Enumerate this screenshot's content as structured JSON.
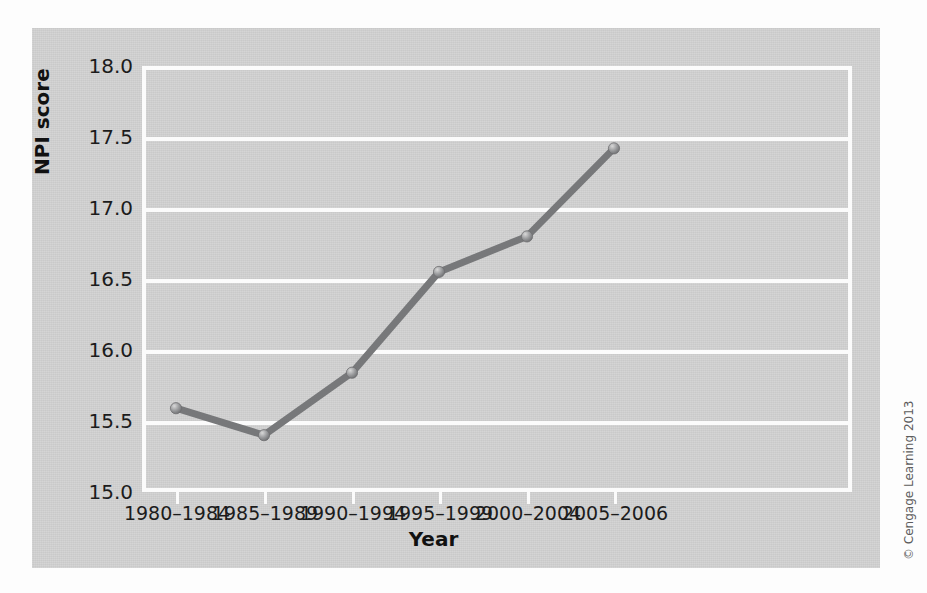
{
  "chart_data": {
    "type": "line",
    "title": "",
    "xlabel": "Year",
    "ylabel": "NPI score",
    "categories": [
      "1980–1984",
      "1985–1989",
      "1990–1994",
      "1995–1999",
      "2000–2004",
      "2005–2006"
    ],
    "values": [
      15.59,
      15.4,
      15.84,
      16.55,
      16.8,
      17.42
    ],
    "series": [
      {
        "name": "NPI score",
        "values": [
          15.59,
          15.4,
          15.84,
          16.55,
          16.8,
          17.42
        ]
      }
    ],
    "ylim": [
      15.0,
      18.0
    ],
    "yticks": [
      15.0,
      15.5,
      16.0,
      16.5,
      17.0,
      17.5,
      18.0
    ],
    "ytick_labels": [
      "15.0",
      "15.5",
      "16.0",
      "16.5",
      "17.0",
      "17.5",
      "18.0"
    ],
    "grid": "horizontal",
    "legend": "none",
    "line_color": "#77787a",
    "marker_color": "#8d8e90",
    "grid_color": "#fbfbfb",
    "plot_background": "#d2d2d2"
  },
  "axes": {
    "y_title": "NPI score",
    "x_title": "Year",
    "y_tick_labels": [
      "18.0",
      "17.5",
      "17.0",
      "16.5",
      "16.0",
      "15.5",
      "15.0"
    ],
    "x_tick_labels": [
      "1980–1984",
      "1985–1989",
      "1990–1994",
      "1995–1999",
      "2000–2004",
      "2005–2006"
    ]
  },
  "credit": {
    "text": "© Cengage Learning 2013"
  }
}
